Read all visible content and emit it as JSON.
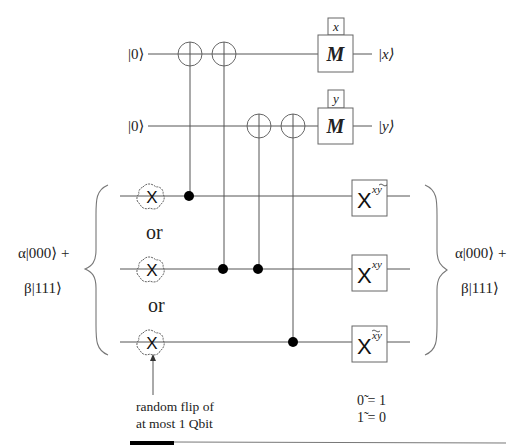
{
  "ancilla_inputs": [
    "|0⟩",
    "|0⟩"
  ],
  "ancilla_outputs": [
    "|x⟩",
    "|y⟩"
  ],
  "measure_gates": [
    {
      "label": "M",
      "result": "x"
    },
    {
      "label": "M",
      "result": "y"
    }
  ],
  "input_state": {
    "line1": "α|000⟩ +",
    "line2": "β|111⟩"
  },
  "output_state": {
    "line1": "α|000⟩ +",
    "line2": "β|111⟩"
  },
  "error_gate_label": "X",
  "or_labels": [
    "or",
    "or"
  ],
  "correction_gates": [
    {
      "base": "X",
      "exponent": "x ỹ"
    },
    {
      "base": "X",
      "exponent": "xy"
    },
    {
      "base": "X",
      "exponent": "x̃y"
    }
  ],
  "annotation": {
    "line1": "random flip of",
    "line2": "at most 1 Qbit"
  },
  "negation_rules": [
    "0̃ = 1",
    "1̃ = 0"
  ],
  "cnot_gates": [
    {
      "control_qubit": 1,
      "target": "ancilla-x"
    },
    {
      "control_qubit": 2,
      "target": "ancilla-x"
    },
    {
      "control_qubit": 2,
      "target": "ancilla-y"
    },
    {
      "control_qubit": 3,
      "target": "ancilla-y"
    }
  ]
}
